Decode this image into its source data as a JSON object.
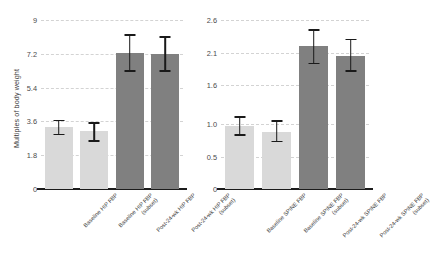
{
  "chart_data": [
    {
      "type": "bar",
      "id": "hip-fbp",
      "title": "",
      "xlabel": "",
      "ylabel": "Multiples of body weight",
      "ylim": [
        0,
        9
      ],
      "yticks": [
        0,
        1.8,
        3.6,
        5.4,
        7.2,
        9
      ],
      "ytick_labels": [
        "0",
        "1.8",
        "3.6",
        "5.4",
        "7.2",
        "9"
      ],
      "grid": true,
      "legend": "none",
      "categories": [
        "Baseline HIP FBP",
        "Baseline HIP FBP (subset)",
        "Post-24-wk HIP FBP",
        "Post-24-wk HIP FBP (subset)"
      ],
      "category_lines": [
        [
          "Baseline HIP FBP",
          ""
        ],
        [
          "Baseline HIP FBP",
          "(subset)"
        ],
        [
          "Post-24-wk HIP FBP",
          ""
        ],
        [
          "Post-24-wk HIP FBP",
          "(subset)"
        ]
      ],
      "values": [
        3.3,
        3.1,
        7.25,
        7.2
      ],
      "err_low": [
        2.9,
        2.55,
        6.3,
        6.3
      ],
      "err_high": [
        3.65,
        3.5,
        8.2,
        8.1
      ],
      "bar_colors": [
        "#d9d9d9",
        "#d9d9d9",
        "#808080",
        "#808080"
      ],
      "bar_shades": [
        "light",
        "light",
        "dark",
        "dark"
      ]
    },
    {
      "type": "bar",
      "id": "spine-fbp",
      "title": "",
      "xlabel": "",
      "ylabel": "",
      "ylim": [
        0,
        2.6
      ],
      "yticks": [
        0,
        0.5,
        1.0,
        1.6,
        2.1,
        2.6
      ],
      "ytick_labels": [
        "0",
        "0.5",
        "1.0",
        "1.6",
        "2.1",
        "2.6"
      ],
      "grid": true,
      "legend": "none",
      "categories": [
        "Baseline SPINE FBP",
        "Baseline SPINE FBP (subset)",
        "Post-24-wk SPINE FBP",
        "Post-24-wk SPINE FBP (subset)"
      ],
      "category_lines": [
        [
          "Baseline SPINE FBP",
          ""
        ],
        [
          "Baseline SPINE FBP",
          "(subset)"
        ],
        [
          "Post-24-wk SPINE FBP",
          ""
        ],
        [
          "Post-24-wk SPINE FBP",
          "(subset)"
        ]
      ],
      "values": [
        0.97,
        0.88,
        2.2,
        2.05
      ],
      "err_low": [
        0.83,
        0.73,
        1.93,
        1.81
      ],
      "err_high": [
        1.11,
        1.05,
        2.45,
        2.3
      ],
      "bar_colors": [
        "#d9d9d9",
        "#d9d9d9",
        "#808080",
        "#808080"
      ],
      "bar_shades": [
        "light",
        "light",
        "dark",
        "dark"
      ]
    }
  ],
  "style": {
    "background": "#ffffff",
    "grid_color": "#d3d3d3",
    "axis_color": "#1c1c1c",
    "error_color": "#1a1a1a",
    "tick_text_color": "#4a4a4a",
    "label_text_color": "#3d3d3d"
  }
}
